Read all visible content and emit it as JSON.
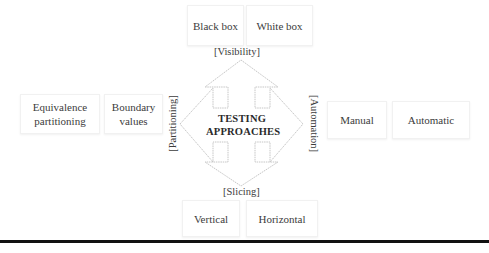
{
  "center": {
    "title_line1": "TESTING",
    "title_line2": "APPROACHES"
  },
  "axes": {
    "top": "[Visibility]",
    "bottom": "[Slicing]",
    "left": "[Partitioning]",
    "right": "[Automation]"
  },
  "boxes": {
    "top": [
      {
        "label": "Black box"
      },
      {
        "label": "White box"
      }
    ],
    "left": [
      {
        "label_line1": "Equivalence",
        "label_line2": "partitioning"
      },
      {
        "label_line1": "Boundary",
        "label_line2": "values"
      }
    ],
    "right": [
      {
        "label": "Manual"
      },
      {
        "label": "Automatic"
      }
    ],
    "bottom": [
      {
        "label": "Vertical"
      },
      {
        "label": "Horizontal"
      }
    ]
  },
  "colors": {
    "arrow_stroke": "#b5b5b5",
    "text": "#3c3c3c",
    "rule": "#111111"
  }
}
